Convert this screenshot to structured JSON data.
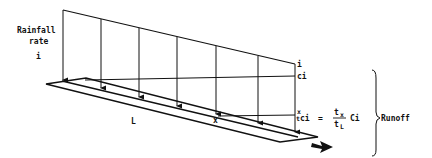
{
  "diagram": {
    "rainfall_label_line1": "Rainfall",
    "rainfall_label_line2": "rate",
    "rainfall_symbol": "i",
    "length_label": "L",
    "point_label": "x",
    "top_right_label": "i",
    "ci_label": "ci",
    "eq_x": "x",
    "eq_ci_left": "ci",
    "eq_equals": "=",
    "eq_numerator": "t",
    "eq_numerator_sub": "x",
    "eq_denominator": "t",
    "eq_denominator_sub": "L",
    "eq_ci_right": "Ci",
    "runoff_label": "Runoff"
  },
  "colors": {
    "ink": "#111111",
    "background": "#ffffff"
  }
}
